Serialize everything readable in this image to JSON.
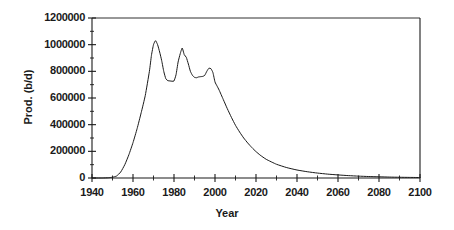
{
  "chart_data": {
    "type": "line",
    "title": "",
    "xlabel": "Year",
    "ylabel": "Prod. (b/d)",
    "xlim": [
      1940,
      2100
    ],
    "ylim": [
      0,
      1200000
    ],
    "grid": false,
    "legend": "none",
    "x_ticks": [
      1940,
      1960,
      1980,
      2000,
      2020,
      2040,
      2060,
      2080,
      2100
    ],
    "x_tick_labels": [
      "1940",
      "1960",
      "1980",
      "2000",
      "2020",
      "2040",
      "2060",
      "2080",
      "2100"
    ],
    "x_minor_tick_interval": 10,
    "y_ticks": [
      0,
      200000,
      400000,
      600000,
      800000,
      1000000,
      1200000
    ],
    "y_tick_labels": [
      "0",
      "200000",
      "400000",
      "600000",
      "800000",
      "1000000",
      "1200000"
    ],
    "y_minor_tick_interval": 100000,
    "line_color": "#1a1a1a",
    "line_width": 1,
    "axis_color": "#1a1a1a",
    "background_color": "#ffffff",
    "series": [
      {
        "name": "Production",
        "x": [
          1940,
          1945,
          1948,
          1950,
          1952,
          1954,
          1956,
          1958,
          1960,
          1962,
          1964,
          1966,
          1968,
          1969,
          1970,
          1971,
          1972,
          1973,
          1974,
          1975,
          1976,
          1977,
          1978,
          1979,
          1980,
          1981,
          1982,
          1983,
          1984,
          1985,
          1986,
          1987,
          1988,
          1989,
          1990,
          1991,
          1992,
          1993,
          1994,
          1995,
          1996,
          1997,
          1998,
          1999,
          2000,
          2001,
          2002,
          2004,
          2006,
          2008,
          2010,
          2012,
          2014,
          2016,
          2018,
          2020,
          2022,
          2025,
          2030,
          2035,
          2040,
          2045,
          2050,
          2055,
          2060,
          2065,
          2070,
          2075,
          2080,
          2085,
          2090,
          2095,
          2100
        ],
        "y": [
          0,
          0,
          2000,
          6000,
          15000,
          45000,
          100000,
          175000,
          265000,
          370000,
          490000,
          620000,
          800000,
          920000,
          1000000,
          1030000,
          1000000,
          945000,
          880000,
          800000,
          745000,
          730000,
          728000,
          726000,
          728000,
          775000,
          870000,
          930000,
          975000,
          925000,
          905000,
          855000,
          800000,
          770000,
          755000,
          752000,
          758000,
          760000,
          762000,
          770000,
          800000,
          823000,
          820000,
          790000,
          720000,
          690000,
          660000,
          590000,
          520000,
          455000,
          395000,
          345000,
          300000,
          262000,
          228000,
          198000,
          172000,
          140000,
          103000,
          78000,
          60000,
          47000,
          37000,
          29000,
          23000,
          18000,
          14000,
          11000,
          9000,
          7000,
          5500,
          4500,
          3500
        ]
      }
    ]
  }
}
